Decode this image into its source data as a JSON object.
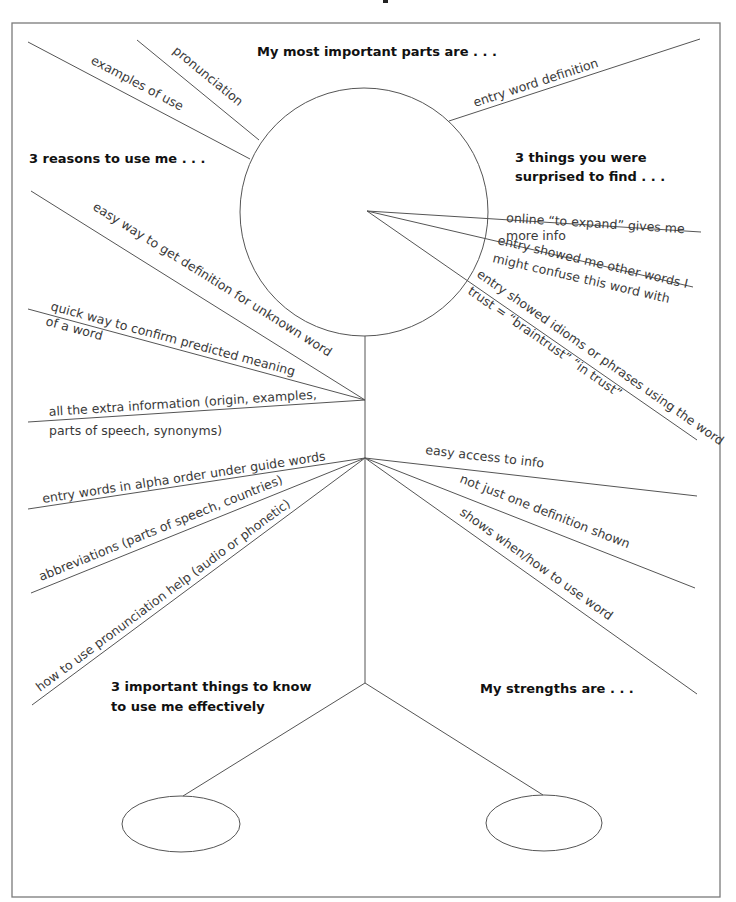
{
  "diagram": {
    "headings": {
      "important_parts": "My most important parts are . . .",
      "reasons": "3 reasons to use me . . .",
      "surprised_1": "3 things you were",
      "surprised_2": "surprised to find . . .",
      "know_1": "3 important things to know",
      "know_2": "to use me effectively",
      "strengths": "My strengths are . . ."
    },
    "important_parts": [
      "examples of use",
      "pronunciation",
      "entry word definition"
    ],
    "surprised": [
      {
        "line1": "online “to expand” gives me",
        "line2": "more info"
      },
      {
        "line1": "entry showed me other words I",
        "line2": "might confuse this word with"
      },
      {
        "line1": "entry showed idioms or phrases using the word",
        "line2": "trust = “braintrust” “in trust”"
      }
    ],
    "reasons": [
      {
        "line1": "easy way to get definition for unknown word"
      },
      {
        "line1": "quick way to confirm predicted meaning",
        "line2": "of a word"
      },
      {
        "line1": "all the extra information (origin, examples,",
        "line2": "parts of speech, synonyms)"
      }
    ],
    "know": [
      "entry words in alpha order under guide words",
      "abbreviations (parts of speech, countries)",
      "how to use pronunciation help (audio or phonetic)"
    ],
    "strengths": [
      "easy access to info",
      "not just one definition shown",
      "shows when/how to use word"
    ]
  }
}
